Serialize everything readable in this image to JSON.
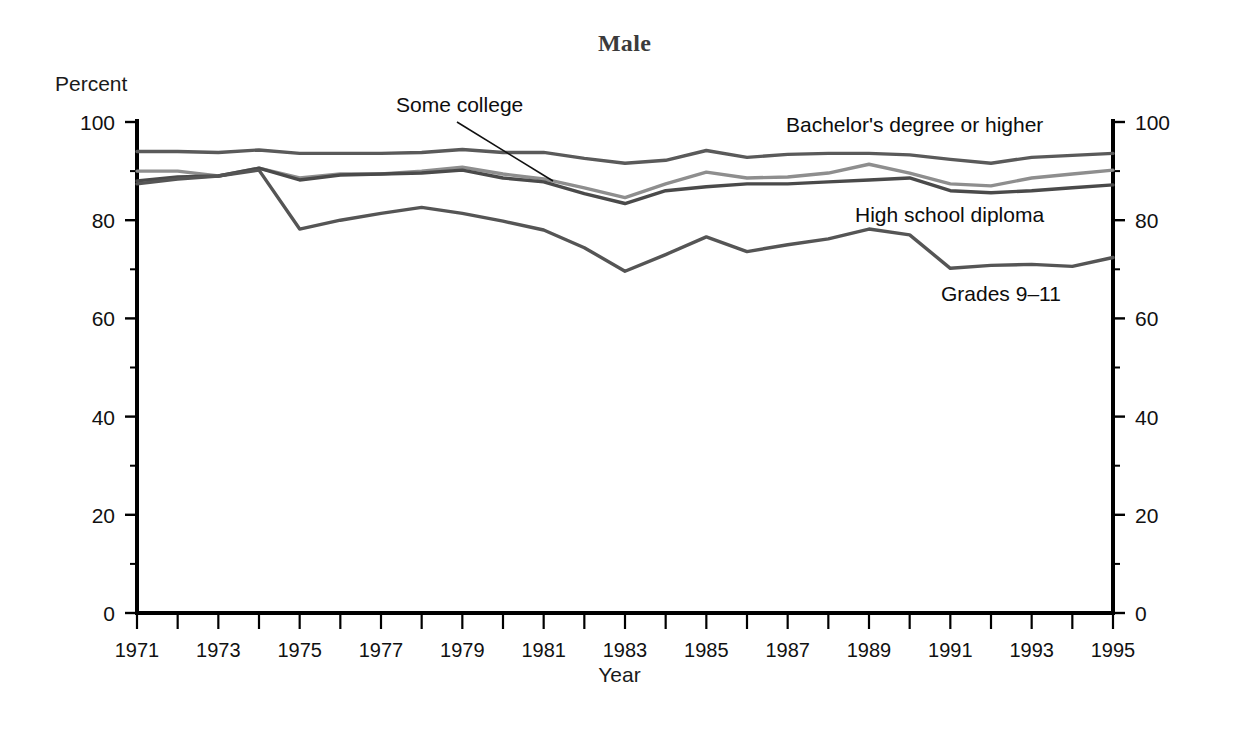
{
  "figure": {
    "title": "Male",
    "y_axis_unit_label": "Percent",
    "x_axis_title": "Year"
  },
  "annotations": {
    "some_college": "Some college",
    "bachelors": "Bachelor's degree or higher",
    "high_school": "High school diploma",
    "grades_9_11": "Grades 9–11"
  },
  "colors": {
    "bachelors": "#5a5a5a",
    "some_college": "#8e8e8e",
    "high_school": "#4a4a4a",
    "grades_9_11": "#555555",
    "axis": "#000000",
    "title": "#3b3b3b"
  },
  "chart_data": {
    "type": "line",
    "title": "Male",
    "xlabel": "Year",
    "ylabel": "Percent",
    "xlim": [
      1971,
      1995
    ],
    "ylim": [
      0,
      100
    ],
    "yticks": [
      0,
      20,
      40,
      60,
      80,
      100
    ],
    "yticks_minor": [
      10,
      30,
      50,
      70,
      90
    ],
    "xticks": [
      1971,
      1972,
      1973,
      1974,
      1975,
      1976,
      1977,
      1978,
      1979,
      1980,
      1981,
      1982,
      1983,
      1984,
      1985,
      1986,
      1987,
      1988,
      1989,
      1990,
      1991,
      1992,
      1993,
      1994,
      1995
    ],
    "xtick_labels": [
      "1971",
      "",
      "1973",
      "",
      "1975",
      "",
      "1977",
      "",
      "1979",
      "",
      "1981",
      "",
      "1983",
      "",
      "1985",
      "",
      "1987",
      "",
      "1989",
      "",
      "1991",
      "",
      "1993",
      "",
      "1995"
    ],
    "grid": false,
    "legend": "inline-annotations",
    "x": [
      1971,
      1972,
      1973,
      1974,
      1975,
      1976,
      1977,
      1978,
      1979,
      1980,
      1981,
      1982,
      1983,
      1984,
      1985,
      1986,
      1987,
      1988,
      1989,
      1990,
      1991,
      1992,
      1993,
      1994,
      1995
    ],
    "series": [
      {
        "name": "Bachelor's degree or higher",
        "color": "#5a5a5a",
        "values": [
          94.0,
          94.0,
          93.8,
          94.3,
          93.6,
          93.6,
          93.6,
          93.8,
          94.4,
          93.8,
          93.8,
          92.6,
          91.6,
          92.2,
          94.2,
          92.8,
          93.4,
          93.6,
          93.6,
          93.3,
          92.4,
          91.6,
          92.8,
          93.2,
          93.6
        ]
      },
      {
        "name": "Some college",
        "color": "#8e8e8e",
        "values": [
          90.0,
          90.0,
          89.0,
          90.6,
          88.6,
          89.4,
          89.4,
          90.0,
          90.8,
          89.4,
          88.4,
          86.6,
          84.6,
          87.4,
          89.8,
          88.6,
          88.8,
          89.6,
          91.4,
          89.6,
          87.4,
          87.0,
          88.6,
          89.4,
          90.2
        ]
      },
      {
        "name": "High school diploma",
        "color": "#4a4a4a",
        "values": [
          88.0,
          88.8,
          89.0,
          90.6,
          88.2,
          89.2,
          89.4,
          89.6,
          90.2,
          88.6,
          87.8,
          85.4,
          83.4,
          86.0,
          86.8,
          87.4,
          87.4,
          87.8,
          88.2,
          88.6,
          86.0,
          85.6,
          86.0,
          86.6,
          87.2
        ]
      },
      {
        "name": "Grades 9–11",
        "color": "#555555",
        "values": [
          87.4,
          88.4,
          89.0,
          90.2,
          78.2,
          80.0,
          81.4,
          82.6,
          81.4,
          79.8,
          78.0,
          74.4,
          69.6,
          73.0,
          76.6,
          73.6,
          75.0,
          76.2,
          78.2,
          77.0,
          70.2,
          70.8,
          71.0,
          70.6,
          72.4
        ]
      }
    ]
  }
}
